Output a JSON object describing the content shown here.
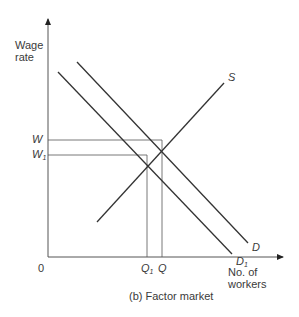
{
  "diagram": {
    "caption": "(b) Factor market",
    "y_axis_label_line1": "Wage",
    "y_axis_label_line2": "rate",
    "x_axis_label_line1": "No. of",
    "x_axis_label_line2": "workers",
    "origin_label": "0",
    "y_ticks": {
      "w": "W",
      "w1": "W",
      "w1_sub": "1"
    },
    "x_ticks": {
      "q1": "Q",
      "q1_sub": "1",
      "q": "Q"
    },
    "curves": {
      "supply": "S",
      "demand": "D",
      "demand1": "D",
      "demand1_sub": "1"
    },
    "line_color": "#3a3a3a"
  }
}
